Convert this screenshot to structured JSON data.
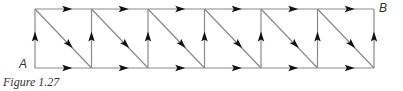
{
  "figure": {
    "caption": "Figure 1.27",
    "start_label": "A",
    "end_label": "B",
    "grid": {
      "columns": 6,
      "x_start": 35,
      "x_step": 56.5,
      "y_top": 9,
      "y_bottom": 68,
      "line_color": "#8a8a8a",
      "arrow_color": "#111111"
    },
    "edges": {
      "vertical": "upward arrow on each vertical edge",
      "top": "rightward arrow on each top edge",
      "bottom": "rightward arrow on each bottom edge",
      "diagonal": "down-right arrow from top-left to bottom-right in each cell"
    }
  }
}
